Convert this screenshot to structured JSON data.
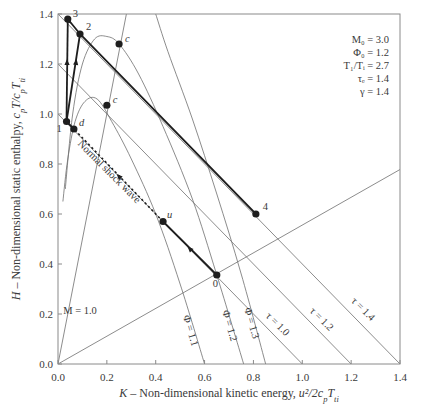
{
  "chart_data": {
    "type": "line",
    "title": "",
    "xlabel": "K – Non-dimensional kinetic energy, u²/2cₚTₜᵢ",
    "xlabel_parts": {
      "var": "K",
      "text": " – Non-dimensional kinetic energy, ",
      "expr": "u²/2c",
      "sub1": "p",
      "expr2": "T",
      "sub2": "ti"
    },
    "ylabel": "H – Non-dimensional static enthalpy, cₚT/cₚTₜᵢ",
    "ylabel_parts": {
      "var": "H",
      "text": " – Non-dimensional static enthalpy, ",
      "e1": "c",
      "s1": "p",
      "e2": "T/c",
      "s2": "p",
      "e3": "T",
      "s3": "ti"
    },
    "xlim": [
      0.0,
      1.4
    ],
    "ylim": [
      0.0,
      1.4
    ],
    "xticks": [
      "0.0",
      "0.2",
      "0.4",
      "0.6",
      "0.8",
      "1.0",
      "1.2",
      "1.4"
    ],
    "yticks": [
      "0.0",
      "0.2",
      "0.4",
      "0.6",
      "0.8",
      "1.0",
      "1.2",
      "1.4"
    ],
    "grid": false,
    "legend": {
      "position": "top-right",
      "entries": [
        "M₀ = 3.0",
        "Φ₀ = 1.2",
        "T₁/Tᵢ = 2.7",
        "τₑ = 1.4",
        "γ = 1.4"
      ]
    },
    "reference_lines": [
      {
        "name": "M = 1.0",
        "label": "M = 1.0",
        "points": [
          [
            0.0,
            0.0
          ],
          [
            0.28,
            1.4
          ]
        ]
      },
      {
        "name": "M = 3.0",
        "label": "",
        "points": [
          [
            0.0,
            0.0
          ],
          [
            1.4,
            0.778
          ]
        ]
      },
      {
        "name": "tau = 1.0",
        "label": "τ = 1.0",
        "points": [
          [
            0.0,
            1.0
          ],
          [
            1.0,
            0.0
          ]
        ]
      },
      {
        "name": "tau = 1.2",
        "label": "τ = 1.2",
        "points": [
          [
            0.0,
            1.2
          ],
          [
            1.2,
            0.0
          ]
        ]
      },
      {
        "name": "tau = 1.4",
        "label": "τ = 1.4",
        "points": [
          [
            0.0,
            1.4
          ],
          [
            1.4,
            0.0
          ]
        ]
      }
    ],
    "phi_curves": [
      {
        "name": "Phi = 1.1",
        "label": "Φ = 1.1",
        "points": [
          [
            0.6,
            0.0
          ],
          [
            0.5,
            0.32
          ],
          [
            0.4,
            0.6
          ],
          [
            0.3,
            0.82
          ],
          [
            0.22,
            0.97
          ],
          [
            0.16,
            1.06
          ],
          [
            0.11,
            1.05
          ],
          [
            0.07,
            0.97
          ],
          [
            0.04,
            0.82
          ],
          [
            0.02,
            0.65
          ]
        ]
      },
      {
        "name": "Phi = 1.2",
        "label": "Φ = 1.2",
        "points": [
          [
            0.76,
            0.0
          ],
          [
            0.65,
            0.356
          ],
          [
            0.55,
            0.66
          ],
          [
            0.43,
            0.95
          ],
          [
            0.33,
            1.16
          ],
          [
            0.25,
            1.28
          ],
          [
            0.2,
            1.31
          ],
          [
            0.15,
            1.3
          ],
          [
            0.1,
            1.2
          ],
          [
            0.06,
            1.0
          ],
          [
            0.03,
            0.7
          ]
        ]
      },
      {
        "name": "Phi = 1.3",
        "label": "Φ = 1.3",
        "points": [
          [
            0.85,
            0.0
          ],
          [
            0.75,
            0.36
          ],
          [
            0.65,
            0.68
          ],
          [
            0.55,
            0.98
          ],
          [
            0.45,
            1.25
          ],
          [
            0.4,
            1.4
          ]
        ]
      }
    ],
    "series": [
      {
        "name": "cycle",
        "style": "bold",
        "points": [
          [
            0.65,
            0.356
          ],
          [
            0.43,
            0.57
          ]
        ],
        "segment": "0-u"
      },
      {
        "name": "normal-shock",
        "style": "dotted",
        "label": "Normal shock wave",
        "points": [
          [
            0.43,
            0.57
          ],
          [
            0.065,
            0.94
          ]
        ],
        "segment": "u-d"
      },
      {
        "name": "cycle",
        "style": "bold",
        "points": [
          [
            0.065,
            0.94
          ],
          [
            0.035,
            0.97
          ]
        ],
        "segment": "d-1"
      },
      {
        "name": "combustion-a",
        "style": "bold",
        "points": [
          [
            0.035,
            0.97
          ],
          [
            0.04,
            1.38
          ]
        ],
        "segment": "1-3"
      },
      {
        "name": "combustion-b",
        "style": "bold",
        "points": [
          [
            0.035,
            0.97
          ],
          [
            0.09,
            1.32
          ]
        ],
        "segment": "1-2"
      },
      {
        "name": "expansion",
        "style": "bold",
        "points": [
          [
            0.04,
            1.38
          ],
          [
            0.09,
            1.32
          ],
          [
            0.81,
            0.6
          ]
        ],
        "segment": "3-2-4"
      }
    ],
    "points": [
      {
        "label": "0",
        "K": 0.65,
        "H": 0.356
      },
      {
        "label": "u",
        "K": 0.43,
        "H": 0.57
      },
      {
        "label": "d",
        "K": 0.065,
        "H": 0.94
      },
      {
        "label": "1",
        "K": 0.035,
        "H": 0.97
      },
      {
        "label": "2",
        "K": 0.09,
        "H": 1.32
      },
      {
        "label": "3",
        "K": 0.04,
        "H": 1.38
      },
      {
        "label": "4",
        "K": 0.81,
        "H": 0.6
      },
      {
        "label": "c",
        "K": 0.25,
        "H": 1.28
      },
      {
        "label": "c",
        "K": 0.2,
        "H": 1.035
      }
    ],
    "annotations": [
      "Normal shock wave",
      "M = 1.0",
      "Φ = 1.1",
      "Φ = 1.2",
      "Φ = 1.3",
      "τ = 1.0",
      "τ = 1.2",
      "τ = 1.4"
    ]
  },
  "colors": {
    "axis": "#8a8a8a",
    "thin": "#6e6e6e",
    "bold": "#1e1e1e",
    "text": "#3a3a3a"
  }
}
